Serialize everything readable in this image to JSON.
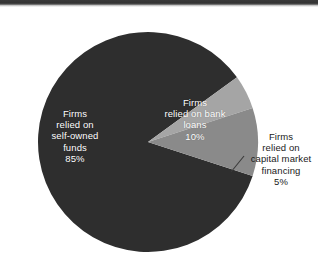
{
  "chart_data": {
    "type": "pie",
    "title": "",
    "subtitle": "",
    "xlabel": "",
    "ylabel": "",
    "grid": false,
    "legend_position": "none",
    "units": "percent",
    "total": 100,
    "categories": [
      "Firms relied on self-owned funds",
      "Firms relied on bank loans",
      "Firms relied on capital market financing"
    ],
    "values": [
      85,
      10,
      5
    ],
    "slices": [
      {
        "id": "self-owned-funds",
        "label_lines": "Firms\nrelied on\nself-owned\nfunds\n85%",
        "label_text": "Firms relied on self-owned funds",
        "value": 85,
        "value_label": "85%",
        "color": "#2e2e2e",
        "text_color": "#ffffff",
        "label_placement": "inside",
        "start_angle_deg": 18,
        "end_angle_deg": 324
      },
      {
        "id": "bank-loans",
        "label_lines": "Firms\nrelied on bank\nloans\n10%",
        "label_text": "Firms relied on bank loans",
        "value": 10,
        "value_label": "10%",
        "color": "#8a8a8a",
        "text_color": "#ffffff",
        "label_placement": "inside",
        "start_angle_deg": 342,
        "end_angle_deg": 18
      },
      {
        "id": "capital-market-financing",
        "label_lines": "Firms\nrelied on\ncapital market\nfinancing\n5%",
        "label_text": "Firms relied on capital market financing",
        "value": 5,
        "value_label": "5%",
        "color": "#a5a5a5",
        "text_color": "#1a1a1a",
        "label_placement": "outside",
        "start_angle_deg": 324,
        "end_angle_deg": 342
      }
    ]
  },
  "figure": {
    "background_color": "#ffffff",
    "pie": {
      "center_x": 148,
      "center_y": 142,
      "radius": 110
    },
    "leader_line": {
      "color": "#3a3a3a",
      "from_x": 231,
      "from_y": 172,
      "to_x": 244,
      "to_y": 156
    },
    "scan_artifact": {
      "color": "#343434",
      "height_px": 5
    }
  }
}
